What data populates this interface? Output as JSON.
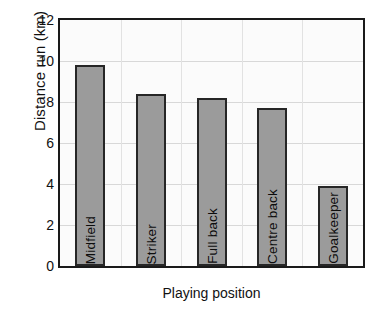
{
  "chart_data": {
    "type": "bar",
    "title": "",
    "xlabel": "Playing position",
    "ylabel": "Distance run (km)",
    "categories": [
      "Midfield",
      "Striker",
      "Full back",
      "Centre back",
      "Goalkeeper"
    ],
    "values": [
      9.8,
      8.4,
      8.2,
      7.7,
      3.9
    ],
    "ylim": [
      0,
      12
    ],
    "yticks": [
      0,
      2,
      4,
      6,
      8,
      10,
      12
    ],
    "ytick_labels": [
      "0",
      "2",
      "4",
      "6",
      "8",
      "10",
      "12"
    ],
    "grid": true,
    "legend": "none",
    "bar_color": "#9b9b9b",
    "bar_border_color": "#262626",
    "axis_color": "#1a1a1a",
    "grid_color": "#d8d8d8",
    "label_placement": "inside-bar-vertical"
  },
  "axes": {
    "y_title": "Distance run (km)",
    "x_title": "Playing position"
  }
}
